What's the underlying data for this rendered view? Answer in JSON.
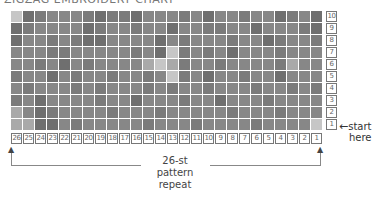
{
  "title": "ZIGZAG EMBROIDERY CHART",
  "chart_data": {
    "type": "heatmap",
    "title": "ZIGZAG EMBROIDERY CHART",
    "columns": 26,
    "rows": 10,
    "column_labels": [
      "26",
      "25",
      "24",
      "23",
      "22",
      "21",
      "20",
      "19",
      "18",
      "17",
      "16",
      "15",
      "14",
      "13",
      "12",
      "11",
      "10",
      "9",
      "8",
      "7",
      "6",
      "5",
      "4",
      "3",
      "2",
      "1"
    ],
    "row_labels": [
      "10",
      "9",
      "8",
      "7",
      "6",
      "5",
      "4",
      "3",
      "2",
      "1"
    ],
    "shade_key": {
      "d": "#6f6f6f",
      "m": "#878787",
      "n": "#7b7b7b",
      "l": "#a9a9a9",
      "x": "#c6c6c6"
    },
    "grid": [
      "xdnmmmndnndmmmnmdmmnmmdnmd",
      "dnmmmmdnmmnmmdmmnnmmdmmmnd",
      "dmmnmnddmmmmdmnmmmnmmdnmmn",
      "mmmnnmmmmmnmdxnmnmdmmmnmmm",
      "mmnmdmnmmmmlxlnmmnmmmmnlmm",
      "nmmdmnmmnmmnmxnmdmmnmmdmmm",
      "mnmmmnmnmmmnmnmmnmmmnmmnmn",
      "nmdmmmmnmmdmmmnmmdmmmnmmmm",
      "lmdnmmmmnmmmnmmmmmnmmmnmmm",
      "llddmnmmmmmnmmmnmmmmnmmmmx"
    ],
    "annotations": [
      "start here",
      "26-st pattern repeat"
    ]
  },
  "row_labels": [
    "10",
    "9",
    "8",
    "7",
    "6",
    "5",
    "4",
    "3",
    "2",
    "1"
  ],
  "col_labels": [
    "26",
    "25",
    "24",
    "23",
    "22",
    "21",
    "20",
    "19",
    "18",
    "17",
    "16",
    "15",
    "14",
    "13",
    "12",
    "11",
    "10",
    "9",
    "8",
    "7",
    "6",
    "5",
    "4",
    "3",
    "2",
    "1"
  ],
  "start_label": {
    "arrow": "←",
    "line1": "start",
    "line2": "here"
  },
  "repeat_label": {
    "line1": "26-st",
    "line2": "pattern",
    "line3": "repeat"
  }
}
